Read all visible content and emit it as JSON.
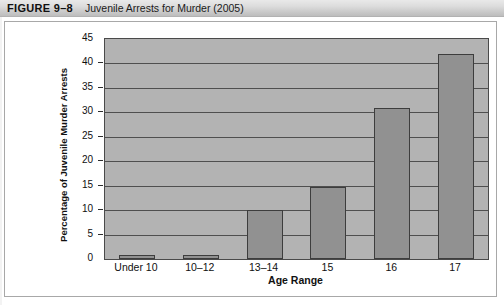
{
  "figure": {
    "number": "FIGURE 9–8",
    "caption": "Juvenile Arrests for Murder (2005)"
  },
  "chart_data": {
    "type": "bar",
    "title": "Juvenile Arrests for Murder (2005)",
    "categories": [
      "Under 10",
      "10–12",
      "13–14",
      "15",
      "16",
      "17"
    ],
    "values": [
      0.8,
      0.8,
      10.0,
      14.7,
      30.9,
      41.9
    ],
    "xlabel": "Age Range",
    "ylabel": "Percentage of Juvenile Murder Arrests",
    "ylim": [
      0,
      45
    ],
    "ytick_labels": [
      "0",
      "5",
      "10",
      "15",
      "20",
      "25",
      "30",
      "35",
      "40",
      "45"
    ],
    "ytick_values": [
      0,
      5,
      10,
      15,
      20,
      25,
      30,
      35,
      40,
      45
    ],
    "grid": true,
    "legend": "none",
    "colors": {
      "bar_fill": "#919191",
      "bar_edge": "#3d3d3d",
      "plot_background": "#b3b3b3",
      "gridline": "#4f4f4f",
      "header_band": "#dcdcdc"
    }
  }
}
